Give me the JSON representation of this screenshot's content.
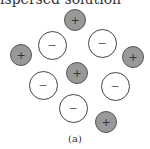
{
  "top_text": "ispersed solution",
  "caption": "(a)",
  "ions": [
    {
      "type": "pos",
      "symbol": "+",
      "x": 75,
      "y": 20
    },
    {
      "type": "neg",
      "symbol": "−",
      "x": 52,
      "y": 45
    },
    {
      "type": "neg",
      "symbol": "−",
      "x": 102,
      "y": 43
    },
    {
      "type": "pos",
      "symbol": "+",
      "x": 21,
      "y": 55
    },
    {
      "type": "pos",
      "symbol": "+",
      "x": 133,
      "y": 57
    },
    {
      "type": "pos",
      "symbol": "+",
      "x": 77,
      "y": 73
    },
    {
      "type": "neg",
      "symbol": "−",
      "x": 43,
      "y": 85
    },
    {
      "type": "neg",
      "symbol": "−",
      "x": 115,
      "y": 86
    },
    {
      "type": "neg",
      "symbol": "−",
      "x": 73,
      "y": 108
    },
    {
      "type": "pos",
      "symbol": "+",
      "x": 106,
      "y": 122
    }
  ],
  "colors": {
    "positive_fill": "#999999",
    "negative_fill": "#ffffff"
  }
}
